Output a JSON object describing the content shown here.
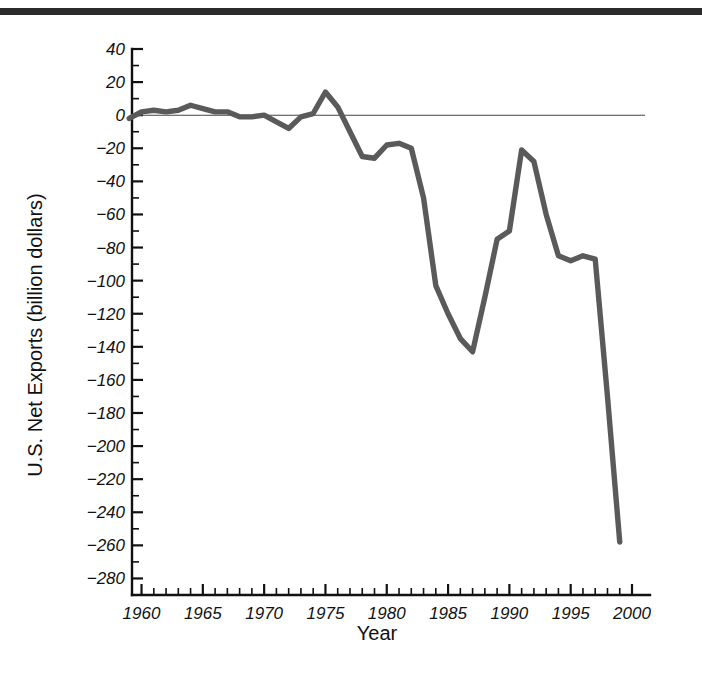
{
  "figure": {
    "top_rule_color": "#2b2b2b",
    "background_color": "#ffffff"
  },
  "chart_data": {
    "type": "line",
    "title": "",
    "xlabel": "Year",
    "ylabel": "U.S. Net Exports (billion dollars)",
    "xlim": [
      1958,
      2000
    ],
    "ylim": [
      -290,
      40
    ],
    "xticks": [
      1960,
      1965,
      1970,
      1975,
      1980,
      1985,
      1990,
      1995,
      2000
    ],
    "xtick_labels": [
      "1960",
      "1965",
      "1970",
      "1975",
      "1980",
      "1985",
      "1990",
      "1995",
      "2000"
    ],
    "xtick_minor_step": 1,
    "yticks": [
      40,
      20,
      0,
      -20,
      -40,
      -60,
      -80,
      -100,
      -120,
      -140,
      -160,
      -180,
      -200,
      -220,
      -240,
      -260,
      -280
    ],
    "ytick_labels": [
      "40",
      "20",
      "0",
      "−20",
      "−40",
      "−60",
      "−80",
      "−100",
      "−120",
      "−140",
      "−160",
      "−180",
      "−200",
      "−220",
      "−240",
      "−260",
      "−280"
    ],
    "ytick_minor_step": 10,
    "grid": false,
    "legend": null,
    "zero_reference_line": 0,
    "line_color": "#5a5a5a",
    "series": [
      {
        "name": "U.S. Net Exports",
        "x": [
          1959,
          1960,
          1961,
          1962,
          1963,
          1964,
          1965,
          1966,
          1967,
          1968,
          1969,
          1970,
          1971,
          1972,
          1973,
          1974,
          1975,
          1976,
          1977,
          1978,
          1979,
          1980,
          1981,
          1982,
          1983,
          1984,
          1985,
          1986,
          1987,
          1988,
          1989,
          1990,
          1991,
          1992,
          1993,
          1994,
          1995,
          1996,
          1997,
          1998,
          1999
        ],
        "values": [
          -2,
          2,
          3,
          2,
          3,
          6,
          4,
          2,
          2,
          -1,
          -1,
          0,
          -4,
          -8,
          -1,
          1,
          14,
          5,
          -10,
          -25,
          -26,
          -18,
          -17,
          -20,
          -50,
          -103,
          -120,
          -135,
          -143,
          -110,
          -75,
          -70,
          -21,
          -28,
          -60,
          -85,
          -88,
          -85,
          -87,
          -170,
          -258
        ],
        "units": "billion dollars"
      }
    ],
    "annotations": []
  }
}
